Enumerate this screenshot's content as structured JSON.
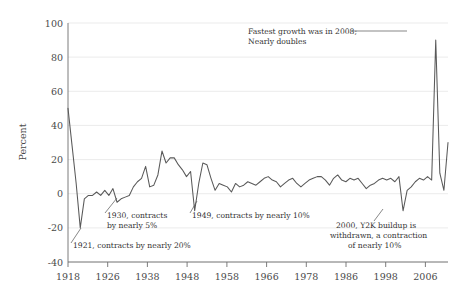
{
  "chart_data": {
    "type": "line",
    "title": "",
    "xlabel": "",
    "ylabel": "Percent",
    "ylim": [
      -40,
      100
    ],
    "xlim": [
      1918,
      2011
    ],
    "grid": true,
    "legend": "none",
    "line_color": "#595959",
    "grid_color": "#e2e2e2",
    "y_ticks": [
      -40,
      -20,
      0,
      20,
      40,
      60,
      80,
      100
    ],
    "y_tick_labels": [
      "-40",
      "-20",
      "0",
      "20",
      "40",
      "60",
      "80",
      "100"
    ],
    "x_ticks": [
      1918,
      1926,
      1938,
      1948,
      1958,
      1966,
      1978,
      1986,
      1998,
      2006
    ],
    "x_tick_labels": [
      "1918",
      "1926",
      "1938",
      "1948",
      "1958",
      "1966",
      "1978",
      "1986",
      "1998",
      "2006"
    ],
    "series": [
      {
        "name": "Percent change",
        "x": [
          1918,
          1919,
          1920,
          1921,
          1922,
          1923,
          1924,
          1925,
          1926,
          1927,
          1928,
          1929,
          1930,
          1931,
          1932,
          1933,
          1934,
          1935,
          1936,
          1937,
          1938,
          1939,
          1940,
          1941,
          1942,
          1943,
          1944,
          1945,
          1946,
          1947,
          1948,
          1949,
          1950,
          1951,
          1952,
          1953,
          1954,
          1955,
          1956,
          1957,
          1958,
          1959,
          1960,
          1961,
          1962,
          1963,
          1964,
          1965,
          1966,
          1967,
          1968,
          1969,
          1970,
          1971,
          1972,
          1973,
          1974,
          1975,
          1976,
          1977,
          1978,
          1979,
          1980,
          1981,
          1982,
          1983,
          1984,
          1985,
          1986,
          1987,
          1988,
          1989,
          1990,
          1991,
          1992,
          1993,
          1994,
          1995,
          1996,
          1997,
          1998,
          1999,
          2000,
          2001,
          2002,
          2003,
          2004,
          2005,
          2006,
          2007,
          2008,
          2009,
          2010,
          2011
        ],
        "values": [
          50,
          28,
          6,
          -20,
          -3,
          -1,
          -1,
          1,
          -1,
          2,
          -1,
          3,
          -5,
          -3,
          -2,
          -1,
          4,
          7,
          9,
          16,
          4,
          5,
          11,
          25,
          18,
          21,
          21,
          17,
          14,
          10,
          13,
          -10,
          6,
          18,
          17,
          9,
          2,
          6,
          5,
          4,
          1,
          6,
          4,
          5,
          7,
          6,
          5,
          7,
          9,
          10,
          8,
          7,
          4,
          6,
          8,
          9,
          6,
          4,
          6,
          8,
          9,
          10,
          10,
          8,
          5,
          9,
          11,
          8,
          7,
          9,
          8,
          9,
          6,
          3,
          5,
          6,
          8,
          9,
          8,
          9,
          7,
          10,
          -10,
          2,
          4,
          7,
          9,
          8,
          10,
          8,
          90,
          12,
          2,
          30
        ]
      }
    ],
    "annotations": [
      {
        "id": "anno-1918-2008",
        "text_line1": "Fastest growth was in 2008;",
        "text_line2": "Nearly doubles"
      },
      {
        "id": "anno-1930",
        "text_line1": "1930, contracts",
        "text_line2": "by nearly 5%"
      },
      {
        "id": "anno-1949",
        "text_line1": "1949, contracts by nearly 10%",
        "text_line2": ""
      },
      {
        "id": "anno-1921",
        "text_line1": "1921, contracts by nearly 20%",
        "text_line2": ""
      },
      {
        "id": "anno-2000",
        "text_line1": "2000, Y2K buildup is",
        "text_line2": "withdrawn, a contraction",
        "text_line3": "of nearly 10%"
      }
    ]
  }
}
